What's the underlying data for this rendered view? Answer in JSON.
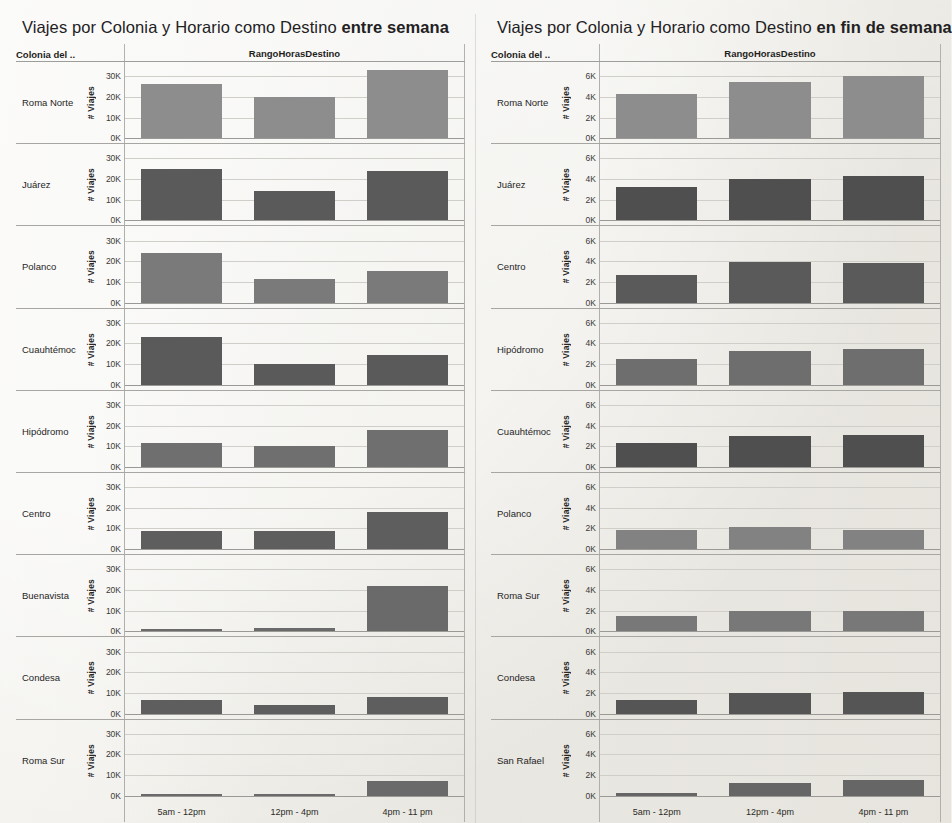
{
  "panels": [
    {
      "id": "weekday",
      "title_normal": "Viajes por Colonia y  Horario como Destino ",
      "title_bold": "entre semana",
      "header": {
        "colonia": "Colonia del ..",
        "range": "RangoHorasDestino"
      },
      "axis_title": "# Viajes",
      "ticks": [
        "30K",
        "20K",
        "10K",
        "0K"
      ],
      "categories": [
        "5am - 12pm",
        "12pm - 4pm",
        "4pm - 11 pm"
      ],
      "rows": [
        {
          "label": "Roma Norte",
          "values": [
            26000,
            20000,
            33000
          ],
          "shade": "#8d8d8d"
        },
        {
          "label": "Juárez",
          "values": [
            25000,
            14000,
            24000
          ],
          "shade": "#5a5a5a"
        },
        {
          "label": "Polanco",
          "values": [
            24000,
            11500,
            15500
          ],
          "shade": "#7a7a7a"
        },
        {
          "label": "Cuauhtémoc",
          "values": [
            23000,
            10000,
            14500
          ],
          "shade": "#5a5a5a"
        },
        {
          "label": "Hipódromo",
          "values": [
            11500,
            10000,
            18000
          ],
          "shade": "#6f6f6f"
        },
        {
          "label": "Centro",
          "values": [
            9000,
            9000,
            18000
          ],
          "shade": "#5e5e5e"
        },
        {
          "label": "Buenavista",
          "values": [
            900,
            1600,
            22000
          ],
          "shade": "#6a6a6a"
        },
        {
          "label": "Condesa",
          "values": [
            6500,
            4000,
            8000
          ],
          "shade": "#5e5e5e"
        },
        {
          "label": "Roma Sur",
          "values": [
            700,
            600,
            7000
          ],
          "shade": "#6a6a6a"
        }
      ]
    },
    {
      "id": "weekend",
      "title_normal": "Viajes por Colonia y  Horario como Destino ",
      "title_bold": "en fin de semana",
      "header": {
        "colonia": "Colonia del ..",
        "range": "RangoHorasDestino"
      },
      "axis_title": "# Viajes",
      "ticks": [
        "6K",
        "4K",
        "2K",
        "0K"
      ],
      "categories": [
        "5am - 12pm",
        "12pm - 4pm",
        "4pm - 11 pm"
      ],
      "rows": [
        {
          "label": "Roma Norte",
          "values": [
            4300,
            5400,
            6000
          ],
          "shade": "#8d8d8d"
        },
        {
          "label": "Juárez",
          "values": [
            3200,
            4000,
            4300
          ],
          "shade": "#4f4f4f"
        },
        {
          "label": "Centro",
          "values": [
            2700,
            3900,
            3800
          ],
          "shade": "#5a5a5a"
        },
        {
          "label": "Hipódromo",
          "values": [
            2500,
            3300,
            3500
          ],
          "shade": "#6e6e6e"
        },
        {
          "label": "Cuauhtémoc",
          "values": [
            2300,
            3000,
            3100
          ],
          "shade": "#4f4f4f"
        },
        {
          "label": "Polanco",
          "values": [
            1900,
            2100,
            1900
          ],
          "shade": "#828282"
        },
        {
          "label": "Roma Sur",
          "values": [
            1500,
            2000,
            2000
          ],
          "shade": "#787878"
        },
        {
          "label": "Condesa",
          "values": [
            1300,
            2000,
            2100
          ],
          "shade": "#555555"
        },
        {
          "label": "San Rafael",
          "values": [
            300,
            1200,
            1500
          ],
          "shade": "#666666"
        }
      ]
    }
  ],
  "chart_data": {
    "type": "bar",
    "layout": "small-multiples, 2 panels × 9 colonia rows × 3 time-range bars",
    "xlabel": "RangoHorasDestino",
    "ylabel": "# Viajes",
    "categories": [
      "5am - 12pm",
      "12pm - 4pm",
      "4pm - 11 pm"
    ],
    "panels": [
      {
        "name": "entre semana",
        "ylim": [
          0,
          33000
        ],
        "yticks": [
          "0K",
          "10K",
          "20K",
          "30K"
        ],
        "series": [
          {
            "name": "Roma Norte",
            "values": [
              26000,
              20000,
              33000
            ]
          },
          {
            "name": "Juárez",
            "values": [
              25000,
              14000,
              24000
            ]
          },
          {
            "name": "Polanco",
            "values": [
              24000,
              11500,
              15500
            ]
          },
          {
            "name": "Cuauhtémoc",
            "values": [
              23000,
              10000,
              14500
            ]
          },
          {
            "name": "Hipódromo",
            "values": [
              11500,
              10000,
              18000
            ]
          },
          {
            "name": "Centro",
            "values": [
              9000,
              9000,
              18000
            ]
          },
          {
            "name": "Buenavista",
            "values": [
              900,
              1600,
              22000
            ]
          },
          {
            "name": "Condesa",
            "values": [
              6500,
              4000,
              8000
            ]
          },
          {
            "name": "Roma Sur",
            "values": [
              700,
              600,
              7000
            ]
          }
        ]
      },
      {
        "name": "en fin de semana",
        "ylim": [
          0,
          6500
        ],
        "yticks": [
          "0K",
          "2K",
          "4K",
          "6K"
        ],
        "series": [
          {
            "name": "Roma Norte",
            "values": [
              4300,
              5400,
              6000
            ]
          },
          {
            "name": "Juárez",
            "values": [
              3200,
              4000,
              4300
            ]
          },
          {
            "name": "Centro",
            "values": [
              2700,
              3900,
              3800
            ]
          },
          {
            "name": "Hipódromo",
            "values": [
              2500,
              3300,
              3500
            ]
          },
          {
            "name": "Cuauhtémoc",
            "values": [
              2300,
              3000,
              3100
            ]
          },
          {
            "name": "Polanco",
            "values": [
              1900,
              2100,
              1900
            ]
          },
          {
            "name": "Roma Sur",
            "values": [
              1500,
              2000,
              2000
            ]
          },
          {
            "name": "Condesa",
            "values": [
              1300,
              2000,
              2100
            ]
          },
          {
            "name": "San Rafael",
            "values": [
              300,
              1200,
              1500
            ]
          }
        ]
      }
    ],
    "grid": true,
    "legend": "none"
  }
}
